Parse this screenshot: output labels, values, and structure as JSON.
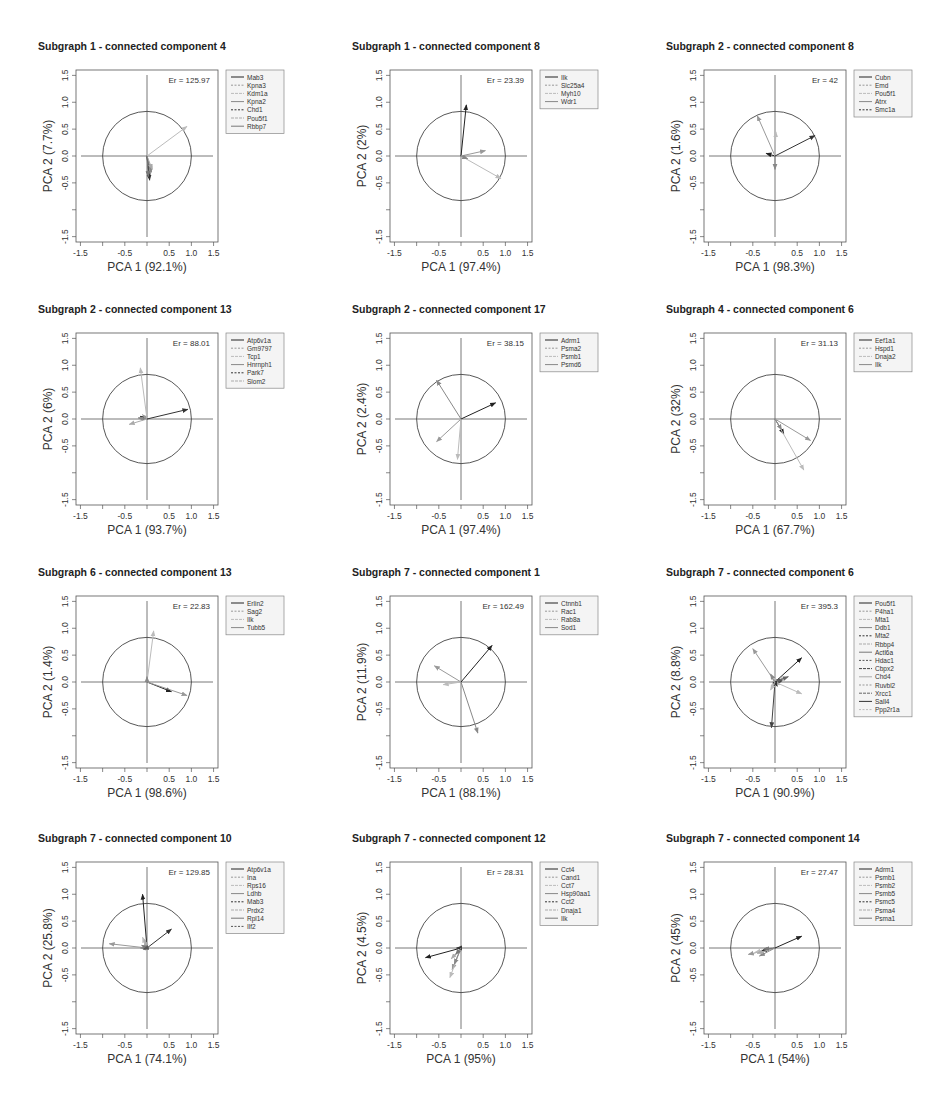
{
  "chart_data": [
    {
      "type": "scatter",
      "subtype": "pca-biplot-arrows",
      "title": "Subgraph 1 - connected component 4",
      "xlabel": "PCA 1 (92.1%)",
      "ylabel": "PCA 2 (7.7%)",
      "annotation": "Er = 125.97",
      "xlim": [
        -1.6,
        1.6
      ],
      "ylim": [
        -1.6,
        1.6
      ],
      "xticks": [
        "-1.5",
        "-0.5",
        "0.5",
        "1.0",
        "1.5"
      ],
      "yticks": [
        "-1.5",
        "-0.5",
        "0.0",
        "0.5",
        "1.0",
        "1.5"
      ],
      "circle_radius": 1.0,
      "legend": [
        "Mab3",
        "Kpna3",
        "Kdm1a",
        "Kpna2",
        "Chd1",
        "Pou5f1",
        "Rbbp7"
      ],
      "arrows": [
        {
          "x": 0.05,
          "y": -0.4
        },
        {
          "x": 0.08,
          "y": -0.35
        },
        {
          "x": 0.9,
          "y": 0.55
        },
        {
          "x": 0.1,
          "y": -0.3
        },
        {
          "x": 0.06,
          "y": -0.45
        },
        {
          "x": 0.12,
          "y": -0.25
        },
        {
          "x": 0.03,
          "y": -0.38
        }
      ]
    },
    {
      "type": "scatter",
      "subtype": "pca-biplot-arrows",
      "title": "Subgraph 1 - connected component 8",
      "xlabel": "PCA 1 (97.4%)",
      "ylabel": "PCA 2 (2%)",
      "annotation": "Er = 23.39",
      "xlim": [
        -1.6,
        1.6
      ],
      "ylim": [
        -1.6,
        1.6
      ],
      "xticks": [
        "-1.5",
        "-0.5",
        "0.5",
        "1.0",
        "1.5"
      ],
      "yticks": [
        "-1.5",
        "-0.5",
        "0.0",
        "0.5",
        "1.0",
        "1.5"
      ],
      "circle_radius": 1.0,
      "legend": [
        "Ilk",
        "Slc25a4",
        "Myh10",
        "Wdr1"
      ],
      "arrows": [
        {
          "x": 0.12,
          "y": 0.95
        },
        {
          "x": 0.55,
          "y": 0.1
        },
        {
          "x": 0.9,
          "y": -0.42
        },
        {
          "x": 0.15,
          "y": -0.05
        }
      ]
    },
    {
      "type": "scatter",
      "subtype": "pca-biplot-arrows",
      "title": "Subgraph 2 - connected component 8",
      "xlabel": "PCA 1 (98.3%)",
      "ylabel": "PCA 2 (1.6%)",
      "annotation": "Er = 42",
      "xlim": [
        -1.6,
        1.6
      ],
      "ylim": [
        -1.6,
        1.6
      ],
      "xticks": [
        "-1.5",
        "-0.5",
        "0.5",
        "1.0",
        "1.5"
      ],
      "yticks": [
        "-1.5",
        "-0.5",
        "0.0",
        "0.5",
        "1.0",
        "1.5"
      ],
      "circle_radius": 1.0,
      "legend": [
        "Cubn",
        "Emd",
        "Pou5f1",
        "Atrx",
        "Smc1a"
      ],
      "arrows": [
        {
          "x": -0.2,
          "y": 0.05
        },
        {
          "x": -0.4,
          "y": 0.75
        },
        {
          "x": 0.02,
          "y": 0.45
        },
        {
          "x": 0.0,
          "y": -0.25
        },
        {
          "x": 0.9,
          "y": 0.38
        }
      ]
    },
    {
      "type": "scatter",
      "subtype": "pca-biplot-arrows",
      "title": "Subgraph 2 - connected component 13",
      "xlabel": "PCA 1 (93.7%)",
      "ylabel": "PCA 2 (6%)",
      "annotation": "Er = 88.01",
      "xlim": [
        -1.6,
        1.6
      ],
      "ylim": [
        -1.6,
        1.6
      ],
      "xticks": [
        "-1.5",
        "-0.5",
        "0.5",
        "1.0",
        "1.5"
      ],
      "yticks": [
        "-1.5",
        "-0.5",
        "0.0",
        "0.5",
        "1.0",
        "1.5"
      ],
      "circle_radius": 1.0,
      "legend": [
        "Atp6v1a",
        "Gm9797",
        "Tcp1",
        "Hnrnph1",
        "Park7",
        "Slom2"
      ],
      "arrows": [
        {
          "x": -0.15,
          "y": 0.05
        },
        {
          "x": -0.1,
          "y": 0.08
        },
        {
          "x": -0.15,
          "y": 0.95
        },
        {
          "x": -0.2,
          "y": 0.02
        },
        {
          "x": 0.92,
          "y": 0.18
        },
        {
          "x": -0.4,
          "y": -0.1
        }
      ]
    },
    {
      "type": "scatter",
      "subtype": "pca-biplot-arrows",
      "title": "Subgraph 2 - connected component 17",
      "xlabel": "PCA 1 (97.4%)",
      "ylabel": "PCA 2 (2.4%)",
      "annotation": "Er = 38.15",
      "xlim": [
        -1.6,
        1.6
      ],
      "ylim": [
        -1.6,
        1.6
      ],
      "xticks": [
        "-1.5",
        "-0.5",
        "0.5",
        "1.0",
        "1.5"
      ],
      "yticks": [
        "-1.5",
        "-0.5",
        "0.0",
        "0.5",
        "1.0",
        "1.5"
      ],
      "circle_radius": 1.0,
      "legend": [
        "Adrm1",
        "Psma2",
        "Psmb1",
        "Psmd6"
      ],
      "arrows": [
        {
          "x": 0.78,
          "y": 0.3
        },
        {
          "x": -0.55,
          "y": -0.42
        },
        {
          "x": -0.08,
          "y": -0.75
        },
        {
          "x": -0.55,
          "y": 0.72
        }
      ]
    },
    {
      "type": "scatter",
      "subtype": "pca-biplot-arrows",
      "title": "Subgraph 4 - connected component 6",
      "xlabel": "PCA 1 (67.7%)",
      "ylabel": "PCA 2 (32%)",
      "annotation": "Er = 31.13",
      "xlim": [
        -1.6,
        1.6
      ],
      "ylim": [
        -1.6,
        1.6
      ],
      "xticks": [
        "-1.5",
        "-0.5",
        "0.5",
        "1.0",
        "1.5"
      ],
      "yticks": [
        "-1.5",
        "-0.5",
        "0.0",
        "0.5",
        "1.0",
        "1.5"
      ],
      "circle_radius": 1.0,
      "legend": [
        "Eef1a1",
        "Hspd1",
        "Dnaja2",
        "Ilk"
      ],
      "arrows": [
        {
          "x": 0.2,
          "y": -0.28
        },
        {
          "x": 0.8,
          "y": -0.4
        },
        {
          "x": 0.65,
          "y": -0.95
        },
        {
          "x": 0.15,
          "y": -0.2
        }
      ]
    },
    {
      "type": "scatter",
      "subtype": "pca-biplot-arrows",
      "title": "Subgraph 6 - connected component 13",
      "xlabel": "PCA 1 (98.6%)",
      "ylabel": "PCA 2 (1.4%)",
      "annotation": "Er = 22.83",
      "xlim": [
        -1.6,
        1.6
      ],
      "ylim": [
        -1.6,
        1.6
      ],
      "xticks": [
        "-1.5",
        "-0.5",
        "0.5",
        "1.0",
        "1.5"
      ],
      "yticks": [
        "-1.5",
        "-0.5",
        "0.0",
        "0.5",
        "1.0",
        "1.5"
      ],
      "circle_radius": 1.0,
      "legend": [
        "Erlin2",
        "Sag2",
        "Ilk",
        "Tubb5"
      ],
      "arrows": [
        {
          "x": 0.55,
          "y": -0.18
        },
        {
          "x": 0.9,
          "y": -0.25
        },
        {
          "x": 0.15,
          "y": 0.95
        },
        {
          "x": 0.0,
          "y": 0.1
        }
      ]
    },
    {
      "type": "scatter",
      "subtype": "pca-biplot-arrows",
      "title": "Subgraph 7 - connected component 1",
      "xlabel": "PCA 1 (88.1%)",
      "ylabel": "PCA 2 (11.9%)",
      "annotation": "Er = 162.49",
      "xlim": [
        -1.6,
        1.6
      ],
      "ylim": [
        -1.6,
        1.6
      ],
      "xticks": [
        "-1.5",
        "-0.5",
        "0.5",
        "1.0",
        "1.5"
      ],
      "yticks": [
        "-1.5",
        "-0.5",
        "0.0",
        "0.5",
        "1.0",
        "1.5"
      ],
      "circle_radius": 1.0,
      "legend": [
        "Ctnnb1",
        "Rac1",
        "Rab8a",
        "Sod1"
      ],
      "arrows": [
        {
          "x": 0.7,
          "y": 0.68
        },
        {
          "x": -0.6,
          "y": 0.3
        },
        {
          "x": -0.4,
          "y": -0.05
        },
        {
          "x": 0.38,
          "y": -0.95
        }
      ]
    },
    {
      "type": "scatter",
      "subtype": "pca-biplot-arrows",
      "title": "Subgraph 7 - connected component 6",
      "xlabel": "PCA 1 (90.9%)",
      "ylabel": "PCA 2 (8.8%)",
      "annotation": "Er = 395.3",
      "xlim": [
        -1.6,
        1.6
      ],
      "ylim": [
        -1.6,
        1.6
      ],
      "xticks": [
        "-1.5",
        "-0.5",
        "0.5",
        "1.0",
        "1.5"
      ],
      "yticks": [
        "-1.5",
        "-0.5",
        "0.0",
        "0.5",
        "1.0",
        "1.5"
      ],
      "circle_radius": 1.0,
      "legend": [
        "Pou5f1",
        "P4ha1",
        "Mta1",
        "Ddb1",
        "Mta2",
        "Rbbp4",
        "Actl6a",
        "Hdac1",
        "Cbpx2",
        "Chd4",
        "Ruvbl2",
        "Xrcc1",
        "Sall4",
        "Ppp2r1a"
      ],
      "arrows": [
        {
          "x": 0.6,
          "y": 0.45
        },
        {
          "x": -0.5,
          "y": 0.62
        },
        {
          "x": 0.6,
          "y": -0.22
        },
        {
          "x": -0.1,
          "y": 0.15
        },
        {
          "x": 0.2,
          "y": 0.05
        },
        {
          "x": 0.25,
          "y": 0.08
        },
        {
          "x": -0.05,
          "y": -0.1
        },
        {
          "x": 0.15,
          "y": 0.03
        },
        {
          "x": -0.08,
          "y": -0.85
        },
        {
          "x": 0.1,
          "y": -0.05
        },
        {
          "x": -0.05,
          "y": 0.05
        },
        {
          "x": 0.3,
          "y": 0.1
        },
        {
          "x": 0.05,
          "y": -0.08
        },
        {
          "x": -0.1,
          "y": -0.15
        }
      ]
    },
    {
      "type": "scatter",
      "subtype": "pca-biplot-arrows",
      "title": "Subgraph 7 - connected component 10",
      "xlabel": "PCA 1 (74.1%)",
      "ylabel": "PCA 2 (25.8%)",
      "annotation": "Er = 129.85",
      "xlim": [
        -1.6,
        1.6
      ],
      "ylim": [
        -1.6,
        1.6
      ],
      "xticks": [
        "-1.5",
        "-0.5",
        "0.5",
        "1.0",
        "1.5"
      ],
      "yticks": [
        "-1.5",
        "-0.5",
        "0.0",
        "0.5",
        "1.0",
        "1.5"
      ],
      "circle_radius": 1.0,
      "legend": [
        "Atp6v1a",
        "Ina",
        "Rps16",
        "Ldhb",
        "Mab3",
        "Prdx2",
        "Rpl14",
        "Ilf2"
      ],
      "arrows": [
        {
          "x": -0.1,
          "y": 1.0
        },
        {
          "x": -0.85,
          "y": 0.08
        },
        {
          "x": -0.1,
          "y": 0.2
        },
        {
          "x": -0.15,
          "y": 0.0
        },
        {
          "x": 0.55,
          "y": 0.35
        },
        {
          "x": -0.05,
          "y": 0.15
        },
        {
          "x": -0.12,
          "y": 0.05
        },
        {
          "x": -0.08,
          "y": -0.02
        }
      ]
    },
    {
      "type": "scatter",
      "subtype": "pca-biplot-arrows",
      "title": "Subgraph 7 - connected component 12",
      "xlabel": "PCA 1 (95%)",
      "ylabel": "PCA 2 (4.5%)",
      "annotation": "Er = 28.31",
      "xlim": [
        -1.6,
        1.6
      ],
      "ylim": [
        -1.6,
        1.6
      ],
      "xticks": [
        "-1.5",
        "-0.5",
        "0.5",
        "1.0",
        "1.5"
      ],
      "yticks": [
        "-1.5",
        "-0.5",
        "0.0",
        "0.5",
        "1.0",
        "1.5"
      ],
      "circle_radius": 1.0,
      "legend": [
        "Cct4",
        "Cand1",
        "Cct7",
        "Hsp90aa1",
        "Cct2",
        "Dnaja1",
        "Ilk"
      ],
      "arrows": [
        {
          "x": -0.8,
          "y": -0.18
        },
        {
          "x": -0.2,
          "y": -0.4
        },
        {
          "x": -0.25,
          "y": -0.55
        },
        {
          "x": -0.15,
          "y": -0.3
        },
        {
          "x": -0.1,
          "y": 0.0
        },
        {
          "x": -0.22,
          "y": -0.2
        },
        {
          "x": -0.12,
          "y": -0.12
        }
      ]
    },
    {
      "type": "scatter",
      "subtype": "pca-biplot-arrows",
      "title": "Subgraph 7 - connected component 14",
      "xlabel": "PCA 1 (54%)",
      "ylabel": "PCA 2 (45%)",
      "annotation": "Er = 27.47",
      "xlim": [
        -1.6,
        1.6
      ],
      "ylim": [
        -1.6,
        1.6
      ],
      "xticks": [
        "-1.5",
        "-0.5",
        "0.5",
        "1.0",
        "1.5"
      ],
      "yticks": [
        "-1.5",
        "-0.5",
        "0.0",
        "0.5",
        "1.0",
        "1.5"
      ],
      "circle_radius": 1.0,
      "legend": [
        "Adrm1",
        "Psmb1",
        "Psmb2",
        "Psmb5",
        "Psmc5",
        "Psma4",
        "Psma1"
      ],
      "arrows": [
        {
          "x": 0.6,
          "y": 0.22
        },
        {
          "x": -0.6,
          "y": -0.12
        },
        {
          "x": -0.45,
          "y": -0.08
        },
        {
          "x": -0.35,
          "y": -0.15
        },
        {
          "x": -0.3,
          "y": -0.05
        },
        {
          "x": -0.4,
          "y": -0.1
        },
        {
          "x": -0.25,
          "y": -0.02
        }
      ]
    }
  ],
  "colors": {
    "axis": "#555555",
    "circle": "#444444",
    "legend_border": "#888888",
    "legend_bg": "#f4f4f4",
    "arrow_dark": "#222222",
    "arrow_light": "#9a9a9a"
  }
}
